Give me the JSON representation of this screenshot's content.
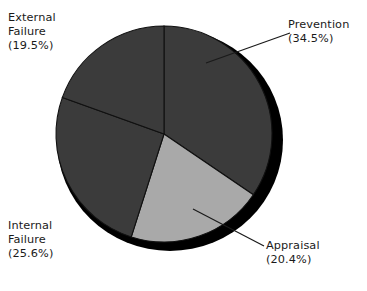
{
  "chart_data": {
    "type": "pie",
    "title": "",
    "subtitle": "",
    "xlabel": "",
    "ylabel": "",
    "legend_position": "none",
    "grid": false,
    "style": "3d-shaded-pie",
    "start_angle_deg": 0,
    "direction": "clockwise",
    "categories": [
      "Prevention",
      "Appraisal",
      "Internal Failure",
      "External Failure"
    ],
    "values": [
      34.5,
      20.4,
      25.6,
      19.5
    ],
    "value_unit": "%",
    "slices": [
      {
        "name": "Prevention",
        "label_line1": "Prevention",
        "label_line2": "(34.5%)",
        "value": 34.5,
        "color": "#3b3b3b"
      },
      {
        "name": "Appraisal",
        "label_line1": "Appraisal",
        "label_line2": "(20.4%)",
        "value": 20.4,
        "color": "#a9a9a9"
      },
      {
        "name": "Internal Failure",
        "label_line1": "Internal",
        "label_line2": "Failure",
        "label_line3": "(25.6%)",
        "value": 25.6,
        "color": "#3b3b3b"
      },
      {
        "name": "External Failure",
        "label_line1": "External",
        "label_line2": "Failure",
        "label_line3": "(19.5%)",
        "value": 19.5,
        "color": "#3b3b3b"
      }
    ]
  },
  "colors": {
    "background": "#ffffff",
    "dark_slice": "#3b3b3b",
    "light_slice": "#a9a9a9",
    "shadow_rim": "#000000",
    "divider": "#111111",
    "leader_line": "#1a1a1a",
    "text": "#1a1a1a"
  }
}
